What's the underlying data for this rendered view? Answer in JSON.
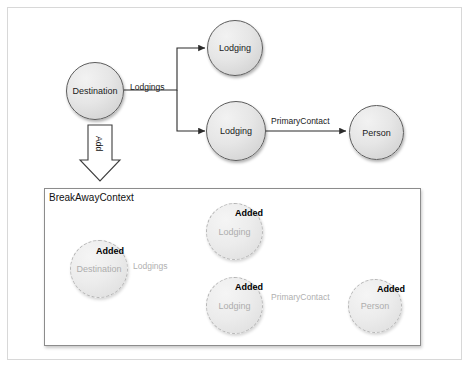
{
  "diagram": {
    "title_label": "BreakAwayContext",
    "transition_label": "Add",
    "added_badge_label": "Added",
    "colors": {
      "node_fill": "#e6e6e6",
      "node_stroke": "#5c5c5c",
      "ghost_stroke": "#b4b4b4",
      "ghost_text": "#adadad",
      "edge": "#333333",
      "ghost_edge": "#bdbdbd",
      "frame": "#d8d8d8",
      "context_border": "#8c8c8c"
    },
    "top_graph": {
      "nodes": [
        {
          "id": "destination",
          "label": "Destination"
        },
        {
          "id": "lodging-top",
          "label": "Lodging"
        },
        {
          "id": "lodging-bottom",
          "label": "Lodging"
        },
        {
          "id": "person",
          "label": "Person"
        }
      ],
      "edges": [
        {
          "id": "lodgings",
          "label": "Lodgings",
          "from": "destination",
          "to": "lodging-top"
        },
        {
          "id": "lodgings-2",
          "label": "",
          "from": "destination",
          "to": "lodging-bottom"
        },
        {
          "id": "primary-contact",
          "label": "PrimaryContact",
          "from": "lodging-bottom",
          "to": "person"
        }
      ]
    },
    "context_graph": {
      "nodes": [
        {
          "id": "destination",
          "label": "Destination",
          "state": "Added"
        },
        {
          "id": "lodging-top",
          "label": "Lodging",
          "state": "Added"
        },
        {
          "id": "lodging-bottom",
          "label": "Lodging",
          "state": "Added"
        },
        {
          "id": "person",
          "label": "Person",
          "state": "Added"
        }
      ],
      "edges": [
        {
          "id": "lodgings",
          "label": "Lodgings",
          "from": "destination",
          "to": "lodging-top"
        },
        {
          "id": "lodgings-2",
          "label": "",
          "from": "destination",
          "to": "lodging-bottom"
        },
        {
          "id": "primary-contact",
          "label": "PrimaryContact",
          "from": "lodging-bottom",
          "to": "person"
        }
      ]
    }
  }
}
